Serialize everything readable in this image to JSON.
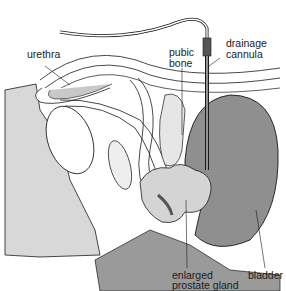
{
  "figure": {
    "colors": {
      "background": "#ffffff",
      "tissue_gray": "#b8b8b8",
      "bladder_gray": "#8f8f8f",
      "light_gray": "#d8d8d8",
      "line": "#1a1a1a"
    },
    "labels": {
      "urethra": "urethra",
      "pubic_bone_1": "pubic",
      "pubic_bone_2": "bone",
      "drainage_cannula_1": "drainage",
      "drainage_cannula_2": "cannula",
      "enlarged_prostate_1": "enlarged",
      "enlarged_prostate_2": "prostate gland",
      "bladder": "bladder"
    }
  }
}
